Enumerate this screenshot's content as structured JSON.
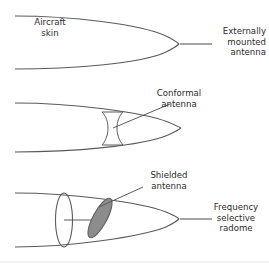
{
  "figure": {
    "background_color": "#ffffff",
    "line_color": "#5a5a5a",
    "text_color": "#2b2b2b",
    "antenna_fill_color": "#8c8c8c",
    "footer_rule_color": "#e8e8e8"
  },
  "panels": [
    {
      "id": "externally-mounted",
      "labels": {
        "aircraft_skin": "Aircraft\nskin",
        "antenna": "Externally\nmounted\nantenna"
      }
    },
    {
      "id": "conformal",
      "labels": {
        "antenna": "Conformal\nantenna"
      }
    },
    {
      "id": "shielded-radome",
      "labels": {
        "antenna": "Shielded\nantenna",
        "radome": "Frequency\nselective\nradome"
      }
    }
  ]
}
